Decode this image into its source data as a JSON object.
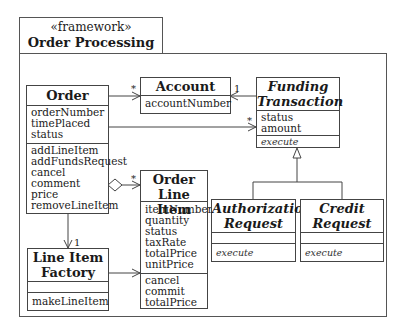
{
  "package": {
    "stereotype": "«framework»",
    "name": "Order Processing"
  },
  "classes": {
    "order": {
      "name": "Order",
      "attributes": [
        "orderNumber",
        "timePlaced",
        "status"
      ],
      "operations": [
        "addLineItem",
        "addFundsRequest",
        "cancel",
        "comment",
        "price",
        "removeLineItem"
      ]
    },
    "account": {
      "name": "Account",
      "attributes": [
        "accountNumber"
      ]
    },
    "funding_transaction": {
      "name_line1": "Funding",
      "name_line2": "Transaction",
      "abstract": true,
      "attributes": [
        "status",
        "amount"
      ],
      "operations": [
        "execute"
      ]
    },
    "order_line_item": {
      "name_line1": "Order",
      "name_line2": "Line Item",
      "attributes": [
        "itemNumber",
        "quantity",
        "status",
        "taxRate",
        "totalPrice",
        "unitPrice"
      ],
      "operations": [
        "cancel",
        "commit",
        "totalPrice"
      ]
    },
    "line_item_factory": {
      "name_line1": "Line Item",
      "name_line2": "Factory",
      "attributes": [],
      "operations": [
        "makeLineItem"
      ]
    },
    "authorization_request": {
      "name_line1": "Authorization",
      "name_line2": "Request",
      "attributes": [],
      "operations": [
        "execute"
      ]
    },
    "credit_request": {
      "name_line1": "Credit",
      "name_line2": "Request",
      "attributes": [],
      "operations": [
        "execute"
      ]
    }
  },
  "relationships": [
    {
      "from": "Order",
      "to": "Account",
      "type": "association",
      "multiplicity_to": "*"
    },
    {
      "from": "Funding Transaction",
      "to": "Account",
      "type": "association",
      "multiplicity_to": "1"
    },
    {
      "from": "Order",
      "to": "Funding Transaction",
      "type": "association",
      "multiplicity_to": "*"
    },
    {
      "from": "Order",
      "to": "Order Line Item",
      "type": "aggregation",
      "multiplicity_to": "*"
    },
    {
      "from": "Order",
      "to": "Line Item Factory",
      "type": "association",
      "multiplicity_to": "1"
    },
    {
      "from": "Line Item Factory",
      "to": "Order Line Item",
      "type": "association"
    },
    {
      "from": "Authorization Request",
      "to": "Funding Transaction",
      "type": "generalization"
    },
    {
      "from": "Credit Request",
      "to": "Funding Transaction",
      "type": "generalization"
    }
  ],
  "multiplicities": {
    "order_account": "*",
    "funding_account": "1",
    "order_funding": "*",
    "order_lineitem": "*",
    "order_factory": "1"
  }
}
